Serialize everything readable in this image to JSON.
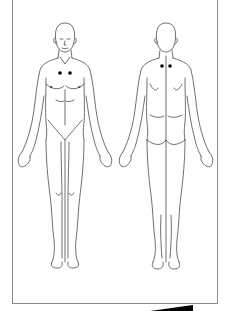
{
  "diagram": {
    "type": "body-chart",
    "views": [
      {
        "name": "front",
        "label": "Anterior view"
      },
      {
        "name": "back",
        "label": "Posterior view"
      }
    ],
    "markers": [
      {
        "view": "front",
        "x": 60,
        "y": 73,
        "color": "#000000"
      },
      {
        "view": "front",
        "x": 70,
        "y": 73,
        "color": "#000000"
      },
      {
        "view": "back",
        "x": 162,
        "y": 66,
        "color": "#000000"
      },
      {
        "view": "back",
        "x": 170,
        "y": 66,
        "color": "#000000"
      }
    ],
    "colors": {
      "line": "#333333",
      "frame": "#8a8a8a",
      "marker": "#000000",
      "background": "#ffffff"
    }
  }
}
